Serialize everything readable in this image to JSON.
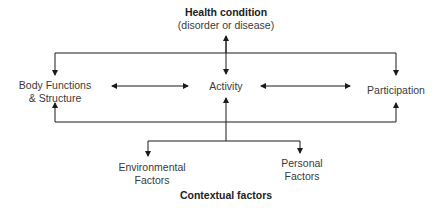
{
  "diagram": {
    "health_condition": {
      "title": "Health condition",
      "subtitle": "(disorder or disease)"
    },
    "nodes": {
      "body_functions": {
        "line1": "Body Functions",
        "line2": "& Structure"
      },
      "activity": {
        "label": "Activity"
      },
      "participation": {
        "label": "Participation"
      },
      "environmental": {
        "line1": "Environmental",
        "line2": "Factors"
      },
      "personal": {
        "line1": "Personal",
        "line2": "Factors"
      }
    },
    "contextual_factors": {
      "title": "Contextual factors"
    },
    "colors": {
      "line": "#1a1a1a",
      "text": "#3a3a3a",
      "background": "#ffffff"
    }
  }
}
